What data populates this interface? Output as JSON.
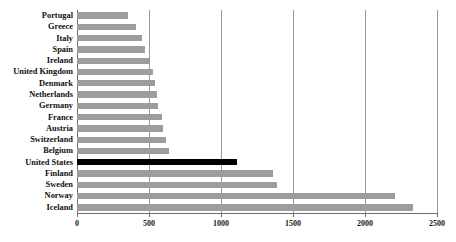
{
  "chart_data": {
    "type": "bar",
    "orientation": "horizontal",
    "title": "",
    "subtitle": "",
    "xlabel": "",
    "ylabel": "",
    "xlim": [
      0,
      2500
    ],
    "ylim": null,
    "grid": true,
    "gridlines_axis": "x",
    "legend": null,
    "legend_position": "none",
    "highlight_category": "United States",
    "series_name": "",
    "colors": {
      "bar": "#9d9d9d",
      "highlight_bar": "#000000",
      "gridline": "#9a9a9a",
      "axis": "#6e6e6e",
      "text": "#111111",
      "background": "#ffffff"
    },
    "xticks": [
      0,
      500,
      1000,
      1500,
      2000,
      2500
    ],
    "xtick_labels": [
      "0",
      "500",
      "1000",
      "1500",
      "2000",
      "2500"
    ],
    "categories": [
      "Portugal",
      "Greece",
      "Italy",
      "Spain",
      "Ireland",
      "United Kingdom",
      "Denmark",
      "Netherlands",
      "Germany",
      "France",
      "Austria",
      "Switzerland",
      "Belgium",
      "United States",
      "Finland",
      "Sweden",
      "Norway",
      "Iceland"
    ],
    "values": [
      355,
      410,
      450,
      470,
      500,
      530,
      540,
      555,
      565,
      590,
      595,
      620,
      640,
      1110,
      1360,
      1390,
      2210,
      2330
    ]
  }
}
